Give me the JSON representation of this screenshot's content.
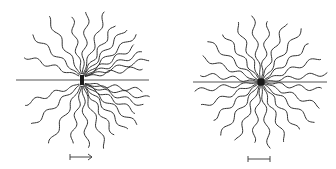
{
  "figure": {
    "panels": [
      {
        "name": "left-panel",
        "description": "chains grafted at an interface, anisotropic",
        "has_interface_line": true,
        "chain_count_upper": 15,
        "chain_count_lower": 15,
        "scale_indicator": "arrow"
      },
      {
        "name": "right-panel",
        "description": "symmetric star with interface line",
        "has_interface_line": true,
        "chain_count": 24,
        "scale_indicator": "bar"
      }
    ],
    "colors": {
      "stroke": "#333333",
      "line": "#555555",
      "background": "#ffffff"
    }
  }
}
